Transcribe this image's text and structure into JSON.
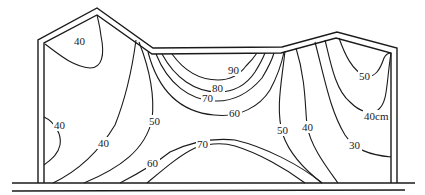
{
  "diagram": {
    "type": "contour cross-section",
    "unit": "cm",
    "stroke_color": "#1a1a1a",
    "background": "#ffffff",
    "structure": {
      "outer_outline": "building profile with left gable peak, flat middle roof and right shallow peak",
      "ground": "double horizontal line at base"
    },
    "labels": [
      {
        "id": "l40_topleft",
        "text": "40",
        "x": 48,
        "y": 45
      },
      {
        "id": "l40_leftwall",
        "text": "40",
        "x": 54,
        "y": 128
      },
      {
        "id": "l40_lowerleft",
        "text": "40",
        "x": 97,
        "y": 146
      },
      {
        "id": "l50_left",
        "text": "50",
        "x": 150,
        "y": 123
      },
      {
        "id": "l60_bottom",
        "text": "60",
        "x": 147,
        "y": 165
      },
      {
        "id": "l70_bottom",
        "text": "70",
        "x": 195,
        "y": 148
      },
      {
        "id": "l90_center",
        "text": "90",
        "x": 228,
        "y": 74
      },
      {
        "id": "l80_center",
        "text": "80",
        "x": 212,
        "y": 91
      },
      {
        "id": "l70_center",
        "text": "70",
        "x": 200,
        "y": 102
      },
      {
        "id": "l60_center",
        "text": "60",
        "x": 228,
        "y": 115
      },
      {
        "id": "l50_right",
        "text": "50",
        "x": 276,
        "y": 133
      },
      {
        "id": "l40_right",
        "text": "40",
        "x": 300,
        "y": 130
      },
      {
        "id": "l50_farright",
        "text": "50",
        "x": 358,
        "y": 79
      },
      {
        "id": "l40cm",
        "text": "40cm",
        "x": 363,
        "y": 119
      },
      {
        "id": "l30",
        "text": "30",
        "x": 348,
        "y": 147
      }
    ],
    "contour_levels": [
      30,
      40,
      50,
      60,
      70,
      80,
      90
    ]
  }
}
